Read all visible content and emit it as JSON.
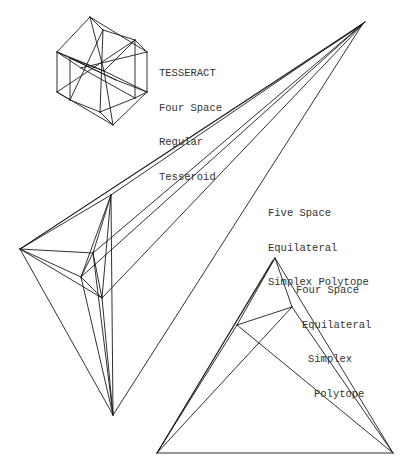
{
  "labels": {
    "tesseract": {
      "lines": [
        "TESSERACT",
        "Four Space",
        "Regular",
        "Tesseroid"
      ],
      "x": 159,
      "y": 45,
      "indents": [
        0,
        0,
        0,
        0
      ]
    },
    "five_simplex": {
      "lines": [
        "Five Space",
        "Equilateral",
        "Simplex Polytope"
      ],
      "x": 268,
      "y": 185,
      "indents": [
        0,
        0,
        0
      ]
    },
    "four_simplex": {
      "lines": [
        "Four Space",
        "Equilateral",
        "Simplex",
        "Polytope"
      ],
      "x": 296,
      "y": 262,
      "indents": [
        0,
        6,
        12,
        18
      ]
    }
  },
  "colors": {
    "stroke": "#1a1a1a",
    "background": "#ffffff",
    "text": "#333333"
  },
  "figures": {
    "tesseract": {
      "vertices": {
        "T": [
          90,
          17
        ],
        "LT": [
          57,
          52
        ],
        "LB": [
          57,
          92
        ],
        "B": [
          113,
          125
        ],
        "RB": [
          147,
          92
        ],
        "RT": [
          147,
          52
        ],
        "C": [
          104,
          71
        ],
        "iT": [
          103,
          30
        ],
        "iLT": [
          70,
          58
        ],
        "iLB": [
          70,
          100
        ],
        "iB": [
          100,
          112
        ],
        "iRB": [
          135,
          98
        ],
        "iRT": [
          135,
          40
        ],
        "iC1": [
          81,
          68
        ],
        "iC2": [
          116,
          80
        ]
      },
      "edges": [
        [
          "T",
          "RT"
        ],
        [
          "RT",
          "RB"
        ],
        [
          "RB",
          "B"
        ],
        [
          "B",
          "LB"
        ],
        [
          "LB",
          "LT"
        ],
        [
          "LT",
          "T"
        ],
        [
          "T",
          "iT"
        ],
        [
          "iT",
          "iRT"
        ],
        [
          "iRT",
          "RT"
        ],
        [
          "iT",
          "iLB"
        ],
        [
          "LT",
          "iLT"
        ],
        [
          "iLT",
          "iLB"
        ],
        [
          "iLB",
          "LB"
        ],
        [
          "iLB",
          "iB"
        ],
        [
          "iB",
          "B"
        ],
        [
          "iB",
          "iRB"
        ],
        [
          "iRB",
          "RB"
        ],
        [
          "iRB",
          "iRT"
        ],
        [
          "LT",
          "C"
        ],
        [
          "C",
          "RB"
        ],
        [
          "iLT",
          "C"
        ],
        [
          "C",
          "iRT"
        ],
        [
          "T",
          "C"
        ],
        [
          "C",
          "B"
        ],
        [
          "iC1",
          "iRB"
        ],
        [
          "iC2",
          "iLT"
        ],
        [
          "iT",
          "iB"
        ],
        [
          "LB",
          "iRT"
        ],
        [
          "iLT",
          "iC2"
        ],
        [
          "iC1",
          "RT"
        ],
        [
          "iC2",
          "RB"
        ],
        [
          "LT",
          "iC1"
        ]
      ]
    },
    "five_simplex": {
      "vertices": {
        "A": [
          365,
          22
        ],
        "L": [
          20,
          249
        ],
        "T": [
          111,
          195
        ],
        "M": [
          93,
          253
        ],
        "LM": [
          81,
          277
        ],
        "LO": [
          102,
          298
        ],
        "B": [
          113,
          415
        ],
        "A2": [
          362,
          25
        ]
      },
      "edges": [
        [
          "A",
          "L"
        ],
        [
          "A2",
          "L"
        ],
        [
          "A",
          "T"
        ],
        [
          "A",
          "M"
        ],
        [
          "A",
          "LM"
        ],
        [
          "A",
          "LO"
        ],
        [
          "A2",
          "B"
        ],
        [
          "L",
          "T"
        ],
        [
          "L",
          "M"
        ],
        [
          "L",
          "LM"
        ],
        [
          "L",
          "LO"
        ],
        [
          "L",
          "B"
        ],
        [
          "T",
          "M"
        ],
        [
          "T",
          "LM"
        ],
        [
          "T",
          "LO"
        ],
        [
          "T",
          "B"
        ],
        [
          "M",
          "LM"
        ],
        [
          "M",
          "LO"
        ],
        [
          "M",
          "B"
        ],
        [
          "LM",
          "LO"
        ],
        [
          "LM",
          "B"
        ],
        [
          "LO",
          "B"
        ]
      ]
    },
    "four_simplex": {
      "vertices": {
        "T": [
          275,
          258
        ],
        "IR": [
          292,
          307
        ],
        "IL": [
          237,
          325
        ],
        "BL": [
          157,
          453
        ],
        "BR": [
          393,
          453
        ],
        "T2": [
          273,
          260
        ]
      },
      "edges": [
        [
          "T",
          "BL"
        ],
        [
          "T2",
          "BL"
        ],
        [
          "T",
          "BR"
        ],
        [
          "T",
          "IR"
        ],
        [
          "IR",
          "IL"
        ],
        [
          "IL",
          "BR"
        ],
        [
          "IR",
          "BL"
        ],
        [
          "IR",
          "BR"
        ],
        [
          "IL",
          "BL"
        ],
        [
          "IL",
          "T"
        ],
        [
          "BL",
          "BR"
        ]
      ]
    }
  }
}
